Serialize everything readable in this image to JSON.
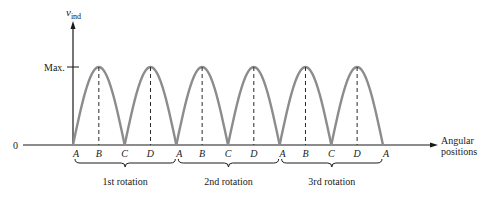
{
  "figure": {
    "y_axis_label": "v",
    "y_axis_subscript": "ind",
    "max_label": "Max.",
    "zero_label": "0",
    "x_axis_label_line1": "Angular",
    "x_axis_label_line2": "positions",
    "positions": [
      "A",
      "B",
      "C",
      "D",
      "A",
      "B",
      "C",
      "D",
      "A",
      "B",
      "C",
      "D",
      "A"
    ],
    "rotations": [
      "1st rotation",
      "2nd rotation",
      "3rd rotation"
    ],
    "colors": {
      "curve": "#8c8c8c",
      "axis": "#1a1a1a",
      "dashed": "#2a2a2a"
    }
  },
  "chart_data": {
    "type": "line",
    "title": "",
    "xlabel": "Angular positions",
    "ylabel": "v_ind",
    "x": [
      "A",
      "B",
      "C",
      "D",
      "A",
      "B",
      "C",
      "D",
      "A",
      "B",
      "C",
      "D",
      "A"
    ],
    "values": [
      0,
      1,
      0,
      1,
      0,
      1,
      0,
      1,
      0,
      1,
      0,
      1,
      0
    ],
    "y_ticks": [
      "0",
      "Max."
    ],
    "groups": [
      "1st rotation",
      "2nd rotation",
      "3rd rotation"
    ]
  }
}
